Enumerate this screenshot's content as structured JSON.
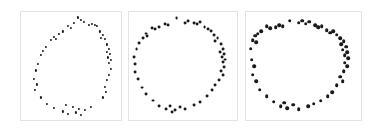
{
  "figure": {
    "background_color": "#ffffff",
    "panel_border_color": "#e3e3e3",
    "marker_color": "#1a1a1a",
    "width": 385,
    "height": 135,
    "panel_count": 3
  },
  "chart_data": [
    {
      "type": "scatter",
      "title": "",
      "xlabel": "",
      "ylabel": "",
      "xlim": [
        0,
        1
      ],
      "ylim": [
        0,
        1
      ],
      "grid": false,
      "legend": null,
      "marker": "circle",
      "marker_size_px": 2.2,
      "marker_color": "#1a1a1a",
      "panel_index": 0,
      "shape": "vertical ellipse ring",
      "n_points": 46,
      "points": [
        [
          0.57,
          0.95
        ],
        [
          0.6,
          0.93
        ],
        [
          0.53,
          0.9
        ],
        [
          0.63,
          0.91
        ],
        [
          0.68,
          0.88
        ],
        [
          0.71,
          0.89
        ],
        [
          0.74,
          0.88
        ],
        [
          0.76,
          0.87
        ],
        [
          0.47,
          0.87
        ],
        [
          0.5,
          0.85
        ],
        [
          0.42,
          0.82
        ],
        [
          0.38,
          0.8
        ],
        [
          0.79,
          0.82
        ],
        [
          0.82,
          0.79
        ],
        [
          0.8,
          0.76
        ],
        [
          0.84,
          0.75
        ],
        [
          0.33,
          0.77
        ],
        [
          0.35,
          0.75
        ],
        [
          0.3,
          0.74
        ],
        [
          0.25,
          0.68
        ],
        [
          0.22,
          0.64
        ],
        [
          0.2,
          0.6
        ],
        [
          0.86,
          0.7
        ],
        [
          0.88,
          0.66
        ],
        [
          0.86,
          0.63
        ],
        [
          0.89,
          0.61
        ],
        [
          0.87,
          0.58
        ],
        [
          0.9,
          0.56
        ],
        [
          0.88,
          0.53
        ],
        [
          0.17,
          0.52
        ],
        [
          0.15,
          0.46
        ],
        [
          0.9,
          0.47
        ],
        [
          0.88,
          0.42
        ],
        [
          0.86,
          0.37
        ],
        [
          0.13,
          0.38
        ],
        [
          0.16,
          0.33
        ],
        [
          0.14,
          0.28
        ],
        [
          0.84,
          0.31
        ],
        [
          0.85,
          0.26
        ],
        [
          0.82,
          0.21
        ],
        [
          0.2,
          0.21
        ],
        [
          0.26,
          0.15
        ],
        [
          0.33,
          0.11
        ],
        [
          0.42,
          0.08
        ],
        [
          0.47,
          0.06
        ],
        [
          0.55,
          0.07
        ],
        [
          0.6,
          0.05
        ],
        [
          0.64,
          0.09
        ],
        [
          0.7,
          0.12
        ],
        [
          0.52,
          0.12
        ],
        [
          0.45,
          0.14
        ],
        [
          0.58,
          0.1
        ]
      ]
    },
    {
      "type": "scatter",
      "title": "",
      "xlabel": "",
      "ylabel": "",
      "xlim": [
        0,
        1
      ],
      "ylim": [
        0,
        1
      ],
      "grid": false,
      "legend": null,
      "marker": "circle",
      "marker_size_px": 2.9,
      "marker_color": "#1a1a1a",
      "panel_index": 1,
      "shape": "circular ring",
      "n_points": 48,
      "points": [
        [
          0.44,
          0.94
        ],
        [
          0.52,
          0.9
        ],
        [
          0.55,
          0.92
        ],
        [
          0.6,
          0.9
        ],
        [
          0.63,
          0.89
        ],
        [
          0.66,
          0.91
        ],
        [
          0.33,
          0.89
        ],
        [
          0.36,
          0.88
        ],
        [
          0.28,
          0.86
        ],
        [
          0.24,
          0.84
        ],
        [
          0.21,
          0.85
        ],
        [
          0.7,
          0.86
        ],
        [
          0.73,
          0.84
        ],
        [
          0.76,
          0.82
        ],
        [
          0.16,
          0.8
        ],
        [
          0.17,
          0.78
        ],
        [
          0.13,
          0.76
        ],
        [
          0.79,
          0.79
        ],
        [
          0.82,
          0.76
        ],
        [
          0.8,
          0.73
        ],
        [
          0.09,
          0.71
        ],
        [
          0.07,
          0.66
        ],
        [
          0.85,
          0.7
        ],
        [
          0.87,
          0.66
        ],
        [
          0.84,
          0.63
        ],
        [
          0.88,
          0.61
        ],
        [
          0.86,
          0.58
        ],
        [
          0.89,
          0.56
        ],
        [
          0.87,
          0.54
        ],
        [
          0.05,
          0.58
        ],
        [
          0.06,
          0.52
        ],
        [
          0.88,
          0.49
        ],
        [
          0.85,
          0.45
        ],
        [
          0.87,
          0.42
        ],
        [
          0.06,
          0.44
        ],
        [
          0.08,
          0.38
        ],
        [
          0.83,
          0.37
        ],
        [
          0.8,
          0.32
        ],
        [
          0.77,
          0.28
        ],
        [
          0.12,
          0.3
        ],
        [
          0.16,
          0.24
        ],
        [
          0.72,
          0.22
        ],
        [
          0.66,
          0.17
        ],
        [
          0.6,
          0.14
        ],
        [
          0.22,
          0.18
        ],
        [
          0.28,
          0.13
        ],
        [
          0.34,
          0.1
        ],
        [
          0.38,
          0.13
        ],
        [
          0.43,
          0.09
        ],
        [
          0.47,
          0.12
        ],
        [
          0.52,
          0.1
        ],
        [
          0.4,
          0.07
        ]
      ]
    },
    {
      "type": "scatter",
      "title": "",
      "xlabel": "",
      "ylabel": "",
      "xlim": [
        0,
        1
      ],
      "ylim": [
        0,
        1
      ],
      "grid": false,
      "legend": null,
      "marker": "circle",
      "marker_size_px": 3.6,
      "marker_color": "#1a1a1a",
      "panel_index": 2,
      "shape": "wide ring",
      "n_points": 50,
      "points": [
        [
          0.38,
          0.92
        ],
        [
          0.46,
          0.9
        ],
        [
          0.49,
          0.92
        ],
        [
          0.52,
          0.89
        ],
        [
          0.55,
          0.91
        ],
        [
          0.29,
          0.88
        ],
        [
          0.32,
          0.87
        ],
        [
          0.26,
          0.86
        ],
        [
          0.21,
          0.85
        ],
        [
          0.18,
          0.87
        ],
        [
          0.6,
          0.88
        ],
        [
          0.63,
          0.86
        ],
        [
          0.66,
          0.87
        ],
        [
          0.13,
          0.82
        ],
        [
          0.1,
          0.8
        ],
        [
          0.08,
          0.78
        ],
        [
          0.7,
          0.83
        ],
        [
          0.73,
          0.81
        ],
        [
          0.76,
          0.82
        ],
        [
          0.79,
          0.79
        ],
        [
          0.06,
          0.74
        ],
        [
          0.09,
          0.72
        ],
        [
          0.82,
          0.76
        ],
        [
          0.85,
          0.73
        ],
        [
          0.83,
          0.7
        ],
        [
          0.87,
          0.68
        ],
        [
          0.84,
          0.65
        ],
        [
          0.88,
          0.63
        ],
        [
          0.86,
          0.6
        ],
        [
          0.04,
          0.66
        ],
        [
          0.89,
          0.57
        ],
        [
          0.86,
          0.53
        ],
        [
          0.88,
          0.5
        ],
        [
          0.05,
          0.56
        ],
        [
          0.07,
          0.5
        ],
        [
          0.85,
          0.45
        ],
        [
          0.82,
          0.4
        ],
        [
          0.84,
          0.36
        ],
        [
          0.06,
          0.42
        ],
        [
          0.09,
          0.36
        ],
        [
          0.79,
          0.32
        ],
        [
          0.75,
          0.26
        ],
        [
          0.71,
          0.22
        ],
        [
          0.12,
          0.28
        ],
        [
          0.18,
          0.22
        ],
        [
          0.65,
          0.18
        ],
        [
          0.59,
          0.15
        ],
        [
          0.54,
          0.13
        ],
        [
          0.24,
          0.17
        ],
        [
          0.3,
          0.13
        ],
        [
          0.36,
          0.11
        ],
        [
          0.41,
          0.14
        ],
        [
          0.46,
          0.1
        ],
        [
          0.33,
          0.16
        ]
      ]
    }
  ],
  "panels": [
    {
      "name": "panel-1",
      "left": 20,
      "top": 11,
      "width": 102,
      "height": 110
    },
    {
      "name": "panel-2",
      "left": 128,
      "top": 11,
      "width": 110,
      "height": 110
    },
    {
      "name": "panel-3",
      "left": 245,
      "top": 11,
      "width": 117,
      "height": 110
    }
  ]
}
